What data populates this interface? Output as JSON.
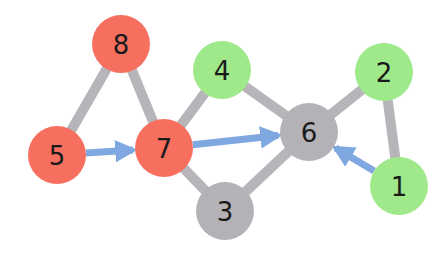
{
  "diagram": {
    "type": "graph",
    "colors": {
      "red": "#f76f5f",
      "green": "#9fe98a",
      "gray": "#b4b2b6",
      "edge_gray": "#b7b5ba",
      "edge_blue": "#7fa8e0",
      "label": "#1a1a1a"
    },
    "nodes": [
      {
        "id": "1",
        "label": "1",
        "color": "green",
        "x": 399,
        "y": 186
      },
      {
        "id": "2",
        "label": "2",
        "color": "green",
        "x": 384,
        "y": 72
      },
      {
        "id": "3",
        "label": "3",
        "color": "gray",
        "x": 225,
        "y": 211
      },
      {
        "id": "4",
        "label": "4",
        "color": "green",
        "x": 222,
        "y": 70
      },
      {
        "id": "5",
        "label": "5",
        "color": "red",
        "x": 57,
        "y": 155
      },
      {
        "id": "6",
        "label": "6",
        "color": "gray",
        "x": 309,
        "y": 132
      },
      {
        "id": "7",
        "label": "7",
        "color": "red",
        "x": 164,
        "y": 148
      },
      {
        "id": "8",
        "label": "8",
        "color": "red",
        "x": 121,
        "y": 44
      }
    ],
    "edges": [
      {
        "from": "8",
        "to": "5",
        "style": "gray",
        "directed": false
      },
      {
        "from": "8",
        "to": "7",
        "style": "gray",
        "directed": false
      },
      {
        "from": "7",
        "to": "4",
        "style": "gray",
        "directed": false
      },
      {
        "from": "7",
        "to": "3",
        "style": "gray",
        "directed": false
      },
      {
        "from": "4",
        "to": "6",
        "style": "gray",
        "directed": false
      },
      {
        "from": "3",
        "to": "6",
        "style": "gray",
        "directed": false
      },
      {
        "from": "6",
        "to": "2",
        "style": "gray",
        "directed": false
      },
      {
        "from": "2",
        "to": "1",
        "style": "gray",
        "directed": false
      },
      {
        "from": "5",
        "to": "7",
        "style": "blue",
        "directed": true
      },
      {
        "from": "7",
        "to": "6",
        "style": "blue",
        "directed": true
      },
      {
        "from": "1",
        "to": "6",
        "style": "blue",
        "directed": true
      }
    ]
  }
}
